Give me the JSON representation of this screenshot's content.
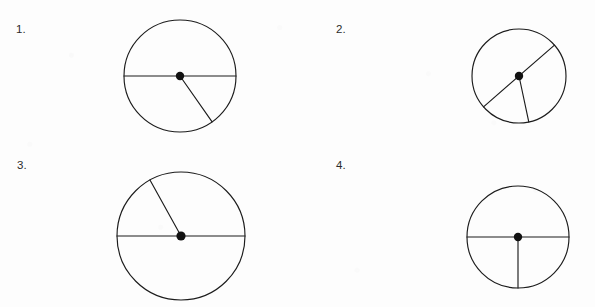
{
  "page": {
    "background_color": "#fdfdfd",
    "ink_color": "#1c1c1c",
    "width": 595,
    "height": 307
  },
  "problems": [
    {
      "number": "1.",
      "number_x": 16,
      "number_y": 24,
      "circle": {
        "cx": 180,
        "cy": 76,
        "r": 56,
        "center_dot_r": 4.2
      },
      "segments": [
        {
          "name": "horizontal-diameter",
          "type": "diameter",
          "angle_deg": 0
        },
        {
          "name": "lower-right-radius",
          "type": "radius",
          "angle_deg": -55
        }
      ]
    },
    {
      "number": "2.",
      "number_x": 336,
      "number_y": 24,
      "circle": {
        "cx": 519,
        "cy": 76,
        "r": 47,
        "center_dot_r": 4.2
      },
      "segments": [
        {
          "name": "oblique-diameter",
          "type": "diameter",
          "angle_deg": 41
        },
        {
          "name": "lower-radius",
          "type": "radius",
          "angle_deg": -78
        }
      ]
    },
    {
      "number": "3.",
      "number_x": 17,
      "number_y": 160,
      "circle": {
        "cx": 181,
        "cy": 236,
        "r": 64,
        "center_dot_r": 4.6
      },
      "segments": [
        {
          "name": "horizontal-diameter",
          "type": "diameter",
          "angle_deg": 0
        },
        {
          "name": "upper-left-radius",
          "type": "radius",
          "angle_deg": 119
        }
      ]
    },
    {
      "number": "4.",
      "number_x": 336,
      "number_y": 160,
      "circle": {
        "cx": 518,
        "cy": 237,
        "r": 51,
        "center_dot_r": 4.2
      },
      "segments": [
        {
          "name": "horizontal-diameter",
          "type": "diameter",
          "angle_deg": 0
        },
        {
          "name": "downward-radius",
          "type": "radius",
          "angle_deg": -90
        }
      ]
    }
  ]
}
